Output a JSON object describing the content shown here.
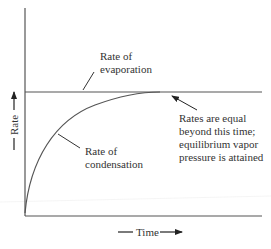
{
  "diagram": {
    "type": "rate-vs-time",
    "axes": {
      "y_label": "Rate",
      "x_label": "Time"
    },
    "curves": [
      {
        "name": "Rate of evaporation",
        "shape": "horizontal constant line"
      },
      {
        "name": "Rate of condensation",
        "shape": "rising curve approaching evaporation rate"
      }
    ],
    "labels": {
      "evaporation_line1": "Rate of",
      "evaporation_line2": "evaporation",
      "condensation_line1": "Rate of",
      "condensation_line2": "condensation",
      "equal_line1": "Rates are equal",
      "equal_line2": "beyond this time;",
      "equal_line3": "equilibrium vapor",
      "equal_line4": "pressure is attained"
    },
    "colors": {
      "line": "#555555",
      "text": "#333333",
      "background": "#ffffff"
    }
  }
}
